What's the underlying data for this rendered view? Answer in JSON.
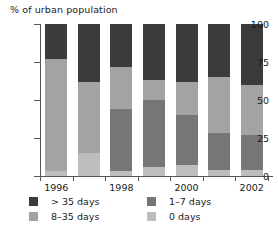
{
  "chart_data": {
    "type": "bar",
    "subtype": "stacked-column-100",
    "title": "% of urban population",
    "xlabel": "",
    "ylabel": "% of urban population",
    "ylim": [
      0,
      100
    ],
    "yticks": [
      0,
      25,
      50,
      75,
      100
    ],
    "ytick_labels": [
      "0",
      "25",
      "50",
      "75",
      "100"
    ],
    "grid": false,
    "legend_position": "bottom",
    "categories": [
      "1996",
      "1997",
      "1998",
      "1999",
      "2000",
      "2001",
      "2002"
    ],
    "xtick_labels": [
      "1996",
      "1998",
      "2000",
      "2002"
    ],
    "xtick_label_indices": [
      0,
      2,
      4,
      6
    ],
    "series": [
      {
        "name": "0 days",
        "color": "#bdbdbd",
        "values": [
          3,
          15,
          3,
          6,
          7,
          4,
          4
        ]
      },
      {
        "name": "1-7 days",
        "color": "#767676",
        "values": [
          0,
          0,
          41,
          44,
          33,
          24,
          23
        ]
      },
      {
        "name": "8-35 days",
        "color": "#a3a3a3",
        "values": [
          74,
          47,
          28,
          13,
          22,
          37,
          33
        ]
      },
      {
        "name": "> 35 days",
        "color": "#3b3b3b",
        "values": [
          23,
          38,
          28,
          37,
          38,
          35,
          40
        ]
      }
    ]
  },
  "legend": {
    "entries": [
      {
        "label": "> 35 days",
        "color": "#3b3b3b"
      },
      {
        "label": "1–7 days",
        "color": "#767676"
      },
      {
        "label": "8–35 days",
        "color": "#a3a3a3"
      },
      {
        "label": "0 days",
        "color": "#bdbdbd"
      }
    ]
  },
  "colors": {
    "axis": "#555555",
    "text": "#1a1a1a",
    "background": "#ffffff"
  }
}
